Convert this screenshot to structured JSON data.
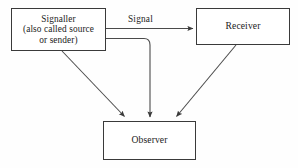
{
  "diagram": {
    "colors": {
      "background": "#fefefe",
      "box_stroke": "#3a3a3a",
      "edge_stroke": "#4a4a4a",
      "text": "#222222"
    },
    "nodes": [
      {
        "id": "signaller",
        "label": "Signaller\n(also called source\nor sender)",
        "x": 11,
        "y": 8,
        "width": 95,
        "height": 43
      },
      {
        "id": "receiver",
        "label": "Receiver",
        "x": 196,
        "y": 8,
        "width": 94,
        "height": 37
      },
      {
        "id": "observer",
        "label": "Observer",
        "x": 103,
        "y": 121,
        "width": 93,
        "height": 39
      }
    ],
    "edges": [
      {
        "id": "signaller-to-receiver",
        "from": "signaller",
        "to": "receiver",
        "label": "Signal",
        "style": "straight-horizontal",
        "arrowhead": "filled-triangle"
      },
      {
        "id": "signaller-to-observer-diagonal",
        "from": "signaller",
        "to": "observer",
        "label": "",
        "style": "diagonal",
        "arrowhead": "filled-triangle"
      },
      {
        "id": "signal-to-observer-elbow",
        "from": "signaller",
        "to": "observer",
        "label": "",
        "style": "elbow-right-then-down",
        "arrowhead": "filled-triangle"
      },
      {
        "id": "receiver-to-observer-diagonal",
        "from": "receiver",
        "to": "observer",
        "label": "",
        "style": "diagonal",
        "arrowhead": "filled-triangle"
      }
    ],
    "edge_labels": {
      "signal": "Signal"
    }
  }
}
